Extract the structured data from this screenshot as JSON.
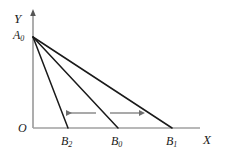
{
  "figure": {
    "type": "diagram",
    "background_color": "#ffffff",
    "line_color": "#1a1a1a",
    "axis_color": "#999999",
    "arrow_color": "#808080"
  },
  "axes": {
    "y": {
      "label": "Y",
      "label_text": "Y",
      "color": "#8a8a8a",
      "has_arrowhead": true
    },
    "x": {
      "label": "X",
      "label_text": "X",
      "color": "#999999",
      "has_arrowhead": false
    },
    "origin": {
      "label": "O",
      "label_text": "O"
    }
  },
  "points": {
    "A0": {
      "base": "A",
      "sub": "0",
      "text": "A0"
    },
    "B0": {
      "base": "B",
      "sub": "0",
      "text": "B0"
    },
    "B1": {
      "base": "B",
      "sub": "1",
      "text": "B1"
    },
    "B2": {
      "base": "B",
      "sub": "2",
      "text": "B2"
    }
  },
  "lines": [
    {
      "name": "budget-line-A0-B2",
      "from": "A0",
      "to": "B2"
    },
    {
      "name": "budget-line-A0-B0",
      "from": "A0",
      "to": "B0"
    },
    {
      "name": "budget-line-A0-B1",
      "from": "A0",
      "to": "B1"
    }
  ],
  "arrows": [
    {
      "name": "shift-left-arrow",
      "direction": "left"
    },
    {
      "name": "shift-right-arrow",
      "direction": "right"
    }
  ]
}
